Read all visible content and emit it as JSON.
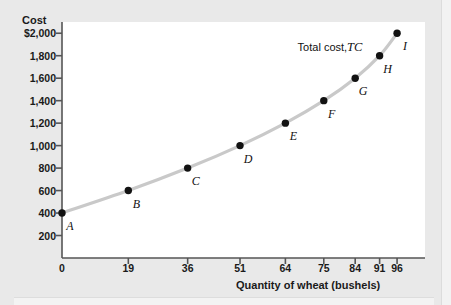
{
  "chart_data": {
    "type": "line",
    "title": "",
    "xlabel": "Quantity of wheat (bushels)",
    "ylabel": "Cost",
    "series_label": "Total cost,",
    "series_symbol": "TC",
    "xlim": [
      0,
      104
    ],
    "ylim": [
      0,
      2100
    ],
    "grid": false,
    "legend_position": "top-right-inline",
    "x_ticks": [
      "0",
      "19",
      "36",
      "51",
      "64",
      "75",
      "84",
      "91",
      "96"
    ],
    "x_tick_values": [
      0,
      19,
      36,
      51,
      64,
      75,
      84,
      91,
      96
    ],
    "y_ticks": [
      "$2,000",
      "1,800",
      "1,600",
      "1,400",
      "1,200",
      "1,000",
      "800",
      "600",
      "400",
      "200"
    ],
    "y_tick_values": [
      2000,
      1800,
      1600,
      1400,
      1200,
      1000,
      800,
      600,
      400,
      200
    ],
    "points": [
      {
        "label": "A",
        "x": 0,
        "y": 400
      },
      {
        "label": "B",
        "x": 19,
        "y": 600
      },
      {
        "label": "C",
        "x": 36,
        "y": 800
      },
      {
        "label": "D",
        "x": 51,
        "y": 1000
      },
      {
        "label": "E",
        "x": 64,
        "y": 1200
      },
      {
        "label": "F",
        "x": 75,
        "y": 1400
      },
      {
        "label": "G",
        "x": 84,
        "y": 1600
      },
      {
        "label": "H",
        "x": 91,
        "y": 1800
      },
      {
        "label": "I",
        "x": 96,
        "y": 2000
      }
    ],
    "colors": {
      "curve": "#c9c9c9",
      "point": "#121212",
      "axis": "#555555",
      "panel": "#ffffff",
      "background": "#e9e9e9",
      "text": "#1a1a1a"
    }
  }
}
